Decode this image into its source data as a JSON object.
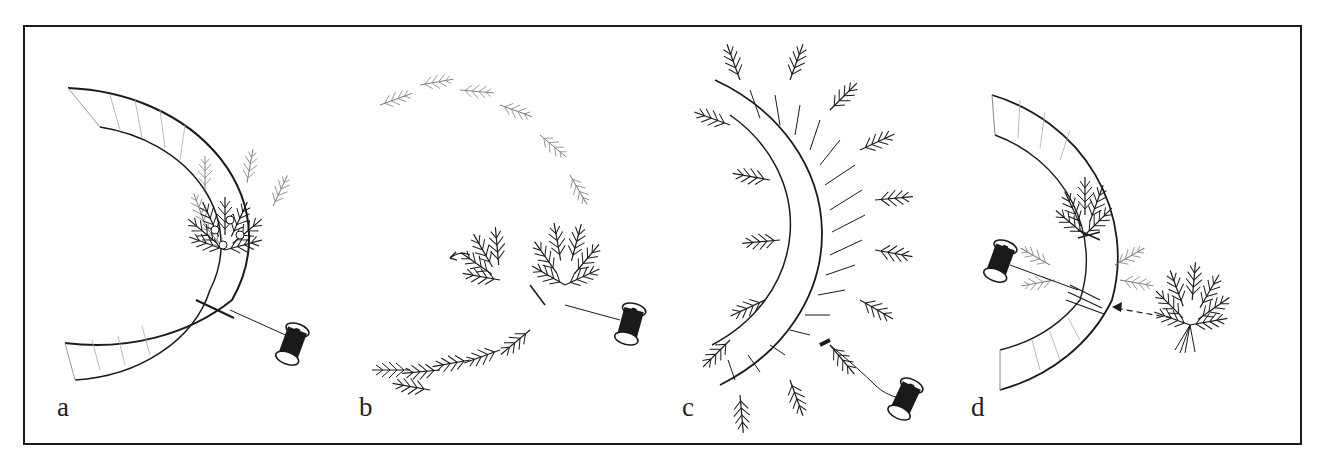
{
  "figure": {
    "colors": {
      "ink": "#1a1a1a",
      "background": "#ffffff"
    },
    "panels": [
      {
        "id": "a",
        "label": "a",
        "caption_hint": "first bundle wired to frame",
        "icon": "spool-icon"
      },
      {
        "id": "b",
        "label": "b",
        "caption_hint": "overlapping bundles around frame",
        "icon": "spool-icon"
      },
      {
        "id": "c",
        "label": "c",
        "caption_hint": "wire wrapped around frame and greenery",
        "icon": "spool-icon"
      },
      {
        "id": "d",
        "label": "d",
        "caption_hint": "next bundle added with arrow",
        "icon": "spool-icon"
      }
    ]
  }
}
